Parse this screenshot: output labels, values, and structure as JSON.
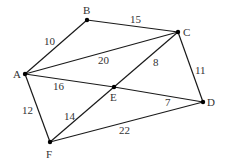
{
  "graph": {
    "nodes": {
      "A": {
        "label": "A",
        "x": 25,
        "y": 74,
        "lx": 13,
        "ly": 78
      },
      "B": {
        "label": "B",
        "x": 87,
        "y": 20,
        "lx": 83,
        "ly": 14
      },
      "C": {
        "label": "C",
        "x": 178,
        "y": 32,
        "lx": 183,
        "ly": 36
      },
      "D": {
        "label": "D",
        "x": 203,
        "y": 102,
        "lx": 207,
        "ly": 106
      },
      "E": {
        "label": "E",
        "x": 114,
        "y": 87,
        "lx": 110,
        "ly": 101
      },
      "F": {
        "label": "F",
        "x": 50,
        "y": 142,
        "lx": 46,
        "ly": 158
      }
    },
    "edges": [
      {
        "from": "A",
        "to": "B",
        "weight": "10",
        "lx": 44,
        "ly": 45
      },
      {
        "from": "B",
        "to": "C",
        "weight": "15",
        "lx": 130,
        "ly": 23
      },
      {
        "from": "A",
        "to": "C",
        "weight": "20",
        "lx": 98,
        "ly": 64
      },
      {
        "from": "A",
        "to": "E",
        "weight": "16",
        "lx": 53,
        "ly": 90
      },
      {
        "from": "E",
        "to": "D",
        "weight": "7",
        "lx": 165,
        "ly": 106
      },
      {
        "from": "C",
        "to": "E",
        "weight": "8",
        "lx": 153,
        "ly": 66
      },
      {
        "from": "E",
        "to": "F",
        "weight": "14",
        "lx": 64,
        "ly": 120
      },
      {
        "from": "C",
        "to": "D",
        "weight": "11",
        "lx": 195,
        "ly": 74
      },
      {
        "from": "A",
        "to": "F",
        "weight": "12",
        "lx": 22,
        "ly": 114
      },
      {
        "from": "F",
        "to": "D",
        "weight": "22",
        "lx": 119,
        "ly": 134
      }
    ]
  }
}
